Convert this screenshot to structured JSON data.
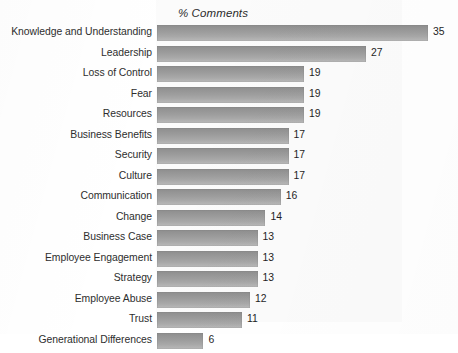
{
  "chart_data": {
    "type": "bar",
    "orientation": "horizontal",
    "title": "% Comments",
    "xlabel": "",
    "ylabel": "",
    "xlim": [
      0,
      35
    ],
    "grid": false,
    "legend": false,
    "value_labels": true,
    "bar_color": "#9d9d9d",
    "plot_background": "#fbfbfb",
    "page_background": "#ffffff",
    "categories": [
      "Knowledge and Understanding",
      "Leadership",
      "Loss of Control",
      "Fear",
      "Resources",
      "Business Benefits",
      "Security",
      "Culture",
      "Communication",
      "Change",
      "Business Case",
      "Employee Engagement",
      "Strategy",
      "Employee Abuse",
      "Trust",
      "Generational Differences"
    ],
    "values": [
      35,
      27,
      19,
      19,
      19,
      17,
      17,
      17,
      16,
      14,
      13,
      13,
      13,
      12,
      11,
      6
    ]
  }
}
